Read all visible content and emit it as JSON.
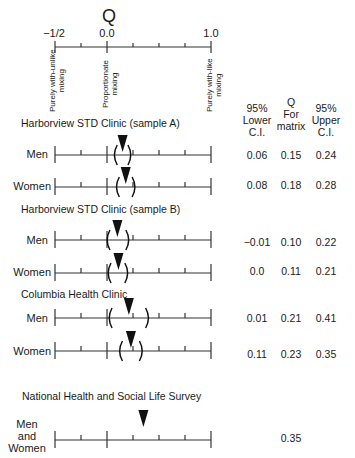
{
  "chart_data": {
    "type": "forest-plot",
    "title": "Q",
    "axis": {
      "min": -0.5,
      "max": 1.0,
      "tick_labels": [
        "−1/2",
        "0.0",
        "1.0"
      ],
      "tick_values": [
        -0.5,
        -0.25,
        0.0,
        0.25,
        0.5,
        0.75,
        1.0
      ],
      "anchor_labels": [
        {
          "value": -0.5,
          "text": "Purely with-unlike mixing"
        },
        {
          "value": 0.0,
          "text": "Proportionate mixing"
        },
        {
          "value": 1.0,
          "text": "Purely with-like mixing"
        }
      ]
    },
    "columns": [
      "95% Lower C.I.",
      "Q For matrix",
      "95% Upper C.I."
    ],
    "groups": [
      {
        "name": "Harborview STD Clinic (sample A)",
        "rows": [
          {
            "label": "Men",
            "lower": 0.06,
            "q": 0.15,
            "upper": 0.24
          },
          {
            "label": "Women",
            "lower": 0.08,
            "q": 0.18,
            "upper": 0.28
          }
        ]
      },
      {
        "name": "Harborview STD Clinic (sample B)",
        "rows": [
          {
            "label": "Men",
            "lower": -0.01,
            "q": 0.1,
            "upper": 0.22
          },
          {
            "label": "Women",
            "lower": 0.0,
            "q": 0.11,
            "upper": 0.21
          }
        ]
      },
      {
        "name": "Columbia Health Clinic",
        "rows": [
          {
            "label": "Men",
            "lower": 0.01,
            "q": 0.21,
            "upper": 0.41
          },
          {
            "label": "Women",
            "lower": 0.11,
            "q": 0.23,
            "upper": 0.35
          }
        ]
      },
      {
        "name": "National Health and Social Life Survey",
        "rows": [
          {
            "label": "Men and Women",
            "lower": null,
            "q": 0.35,
            "upper": null
          }
        ]
      }
    ]
  },
  "header": {
    "title": "Q",
    "tick_neg_half": "−1/2",
    "tick_zero": "0.0",
    "tick_one": "1.0",
    "anchor_unlike_1": "Purely with-unlike",
    "anchor_unlike_2": "mixing",
    "anchor_prop_1": "Proportionate",
    "anchor_prop_2": "mixing",
    "anchor_like_1": "Purely with-like",
    "anchor_like_2": "mixing",
    "col_lower": [
      "95%",
      "Lower",
      "C.I."
    ],
    "col_q": [
      "Q",
      "For",
      "matrix"
    ],
    "col_upper": [
      "95%",
      "Upper",
      "C.I."
    ]
  },
  "sections": {
    "a": "Harborview STD Clinic (sample A)",
    "b": "Harborview STD Clinic (sample B)",
    "c": "Columbia Health Clinic",
    "d": "National Health and Social Life Survey"
  },
  "rows": {
    "a_men": {
      "label": "Men",
      "lower": "0.06",
      "q": "0.15",
      "upper": "0.24"
    },
    "a_women": {
      "label": "Women",
      "lower": "0.08",
      "q": "0.18",
      "upper": "0.28"
    },
    "b_men": {
      "label": "Men",
      "lower": "−0.01",
      "q": "0.10",
      "upper": "0.22"
    },
    "b_women": {
      "label": "Women",
      "lower": "0.0",
      "q": "0.11",
      "upper": "0.21"
    },
    "c_men": {
      "label": "Men",
      "lower": "0.01",
      "q": "0.21",
      "upper": "0.41"
    },
    "c_women": {
      "label": "Women",
      "lower": "0.11",
      "q": "0.23",
      "upper": "0.35"
    },
    "d_all": {
      "label_1": "Men",
      "label_2": "and",
      "label_3": "Women",
      "q": "0.35"
    }
  }
}
